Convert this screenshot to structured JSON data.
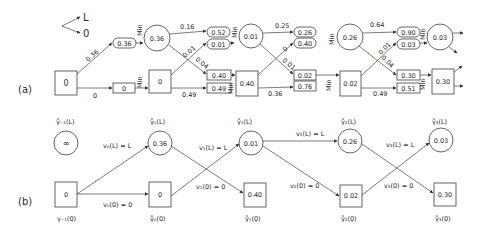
{
  "legend": {
    "up": "L",
    "down": "0"
  },
  "panel_a": {
    "label": "(a)",
    "min_label": "Min",
    "start_box": "0",
    "stages": [
      {
        "from_circle": null,
        "from_box": "0",
        "edge_L_top": "0.36",
        "edge_0_bottom": "0",
        "edge_cross_up": null,
        "edge_cross_down": null,
        "in_pill_top": "0.36",
        "in_pill_bottom": null,
        "in_rect_top": "0",
        "in_rect_bottom": null,
        "circle": "0.36",
        "box": "0"
      },
      {
        "edge_top": "0.16",
        "edge_cross_up": "0.01",
        "edge_cross_down": "0.04",
        "edge_bottom": "0.49",
        "pill_top": "0.52",
        "pill_bottom": "0.01",
        "rect_top": "0.40",
        "rect_bottom": "0.49",
        "circle": "0.01",
        "box": "0.40"
      },
      {
        "edge_top": "0.25",
        "edge_cross_up": "0",
        "edge_cross_down": "0.01",
        "edge_bottom": "0.36",
        "pill_top": "0.26",
        "pill_bottom": "0.40",
        "rect_top": "0.02",
        "rect_bottom": "0.76",
        "circle": "0.26",
        "box": "0.02"
      },
      {
        "edge_top": "0.64",
        "edge_cross_up": "0.01",
        "edge_cross_down": "0.04",
        "edge_bottom": "0.49",
        "pill_top": "0.90",
        "pill_bottom": "0.03",
        "rect_top": "0.30",
        "rect_bottom": "0.51",
        "circle": "0.03",
        "box": "0.30"
      }
    ]
  },
  "panel_b": {
    "label": "(b)",
    "nodes_L": [
      {
        "label": "γ̊₋₁(L)",
        "value": "∞"
      },
      {
        "label": "γ̊₀(L)",
        "value": "0.36"
      },
      {
        "label": "γ̊₁(L)",
        "value": "0.01"
      },
      {
        "label": "γ̊₂(L)",
        "value": "0.26"
      },
      {
        "label": "γ̊₃(L)",
        "value": "0.03"
      }
    ],
    "nodes_0": [
      {
        "label": "γ₋₁(0)",
        "value": "0"
      },
      {
        "label": "γ̊₀(0)",
        "value": "0"
      },
      {
        "label": "γ̊₁(0)",
        "value": "0.40"
      },
      {
        "label": "γ̊₂(0)",
        "value": "0.02"
      },
      {
        "label": "γ̊₃(0)",
        "value": "0.30"
      }
    ],
    "decisions": [
      {
        "L": "v₀(L) = L",
        "zero": "v₀(0) = 0"
      },
      {
        "L": "v₁(L) = L",
        "zero": "v₁(0) = 0"
      },
      {
        "L": "v₂(L) = L",
        "zero": "v₂(0) = 0"
      },
      {
        "L": "v₃(L) = L",
        "zero": "v₃(0) = 0"
      }
    ]
  }
}
